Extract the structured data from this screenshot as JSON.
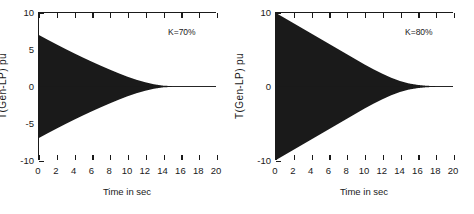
{
  "figure": {
    "background": "#ffffff",
    "trace_color": "#1a1a1a",
    "panel_count": 2
  },
  "chart_data": [
    {
      "type": "line",
      "title": "",
      "xlabel": "Time in sec",
      "ylabel": "T(Gen-LP) pu",
      "xlim": [
        0,
        20
      ],
      "ylim": [
        -10,
        10
      ],
      "xticks": [
        0,
        2,
        4,
        6,
        8,
        10,
        12,
        14,
        16,
        18,
        20
      ],
      "xticklabels": [
        "0",
        "2",
        "4",
        "6",
        "8",
        "10",
        "12",
        "14",
        "16",
        "18",
        "20"
      ],
      "yticks": [
        -10,
        -5,
        0,
        5,
        10
      ],
      "yticklabels": [
        "-10",
        "-5",
        "0",
        "5",
        "10"
      ],
      "grid": false,
      "legend": null,
      "annotation": "K=70%",
      "annotation_x": 16.2,
      "annotation_y": 8.2,
      "description": "Decaying high-frequency torsional oscillation, envelope filled solid black",
      "envelope_amplitude_0": 7.0,
      "envelope_decay_time_const_sec": 3.9,
      "settle_time_sec": 13.5,
      "oscillation_frequency_hz": 25,
      "envelope": {
        "t": [
          0,
          1,
          2,
          3,
          4,
          5,
          6,
          7,
          8,
          9,
          10,
          11,
          12,
          13,
          14,
          15,
          16,
          17,
          18,
          19,
          20
        ],
        "amplitude": [
          7.0,
          6.35,
          5.72,
          5.1,
          4.5,
          3.92,
          3.36,
          2.82,
          2.3,
          1.8,
          1.33,
          0.92,
          0.58,
          0.3,
          0.12,
          0.05,
          0.03,
          0.02,
          0.02,
          0.02,
          0.02
        ]
      }
    },
    {
      "type": "line",
      "title": "",
      "xlabel": "Time in sec",
      "ylabel": "T(Gen-LP) pu",
      "xlim": [
        0,
        20
      ],
      "ylim": [
        -10,
        10
      ],
      "xticks": [
        0,
        2,
        4,
        6,
        8,
        10,
        12,
        14,
        16,
        18,
        20
      ],
      "xticklabels": [
        "0",
        "2",
        "4",
        "6",
        "8",
        "10",
        "12",
        "14",
        "16",
        "18",
        "20"
      ],
      "yticks": [
        -10,
        0,
        10
      ],
      "yticklabels": [
        "-10",
        "0",
        "10"
      ],
      "grid": false,
      "legend": null,
      "annotation": "K=80%",
      "annotation_x": 16.2,
      "annotation_y": 8.2,
      "description": "Decaying high-frequency torsional oscillation with larger initial amplitude and slower decay",
      "envelope_amplitude_0": 10.0,
      "envelope_decay_time_const_sec": 5.2,
      "settle_time_sec": 17.5,
      "oscillation_frequency_hz": 25,
      "envelope": {
        "t": [
          0,
          1,
          2,
          3,
          4,
          5,
          6,
          7,
          8,
          9,
          10,
          11,
          12,
          13,
          14,
          15,
          16,
          17,
          18,
          19,
          20
        ],
        "amplitude": [
          10.0,
          9.3,
          8.6,
          7.9,
          7.2,
          6.5,
          5.8,
          5.1,
          4.4,
          3.7,
          3.0,
          2.35,
          1.75,
          1.2,
          0.75,
          0.42,
          0.22,
          0.1,
          0.05,
          0.03,
          0.03
        ]
      }
    }
  ],
  "panels": [
    {
      "id": "panel-left",
      "annotation": "K=70%",
      "xlabel": "Time in sec",
      "ylabel": "T(Gen-LP) pu",
      "xticklabels": [
        "0",
        "2",
        "4",
        "6",
        "8",
        "10",
        "12",
        "14",
        "16",
        "18",
        "20"
      ],
      "yticklabels": [
        "10",
        "5",
        "0",
        "-5",
        "-10"
      ]
    },
    {
      "id": "panel-right",
      "annotation": "K=80%",
      "xlabel": "Time in sec",
      "ylabel": "T(Gen-LP) pu",
      "xticklabels": [
        "0",
        "2",
        "4",
        "6",
        "8",
        "10",
        "12",
        "14",
        "16",
        "18",
        "20"
      ],
      "yticklabels": [
        "10",
        "0",
        "-10"
      ]
    }
  ]
}
